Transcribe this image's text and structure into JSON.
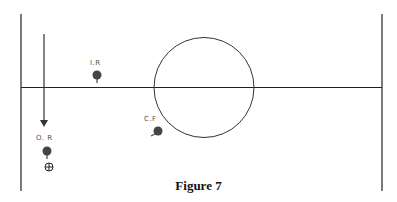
{
  "diagram": {
    "caption": "Figure 7",
    "players": [
      {
        "id": "inside-right",
        "label": "I.R"
      },
      {
        "id": "centre-forward",
        "label": "C.F"
      },
      {
        "id": "outside-right",
        "label": "O. R"
      }
    ],
    "markers": [
      {
        "id": "ball",
        "icon": "circle-cross-icon"
      }
    ],
    "arrows": [
      {
        "id": "run-arrow",
        "direction": "down"
      }
    ],
    "colors": {
      "lines": "#222222",
      "players": "#444444",
      "labels": "#555555"
    }
  }
}
